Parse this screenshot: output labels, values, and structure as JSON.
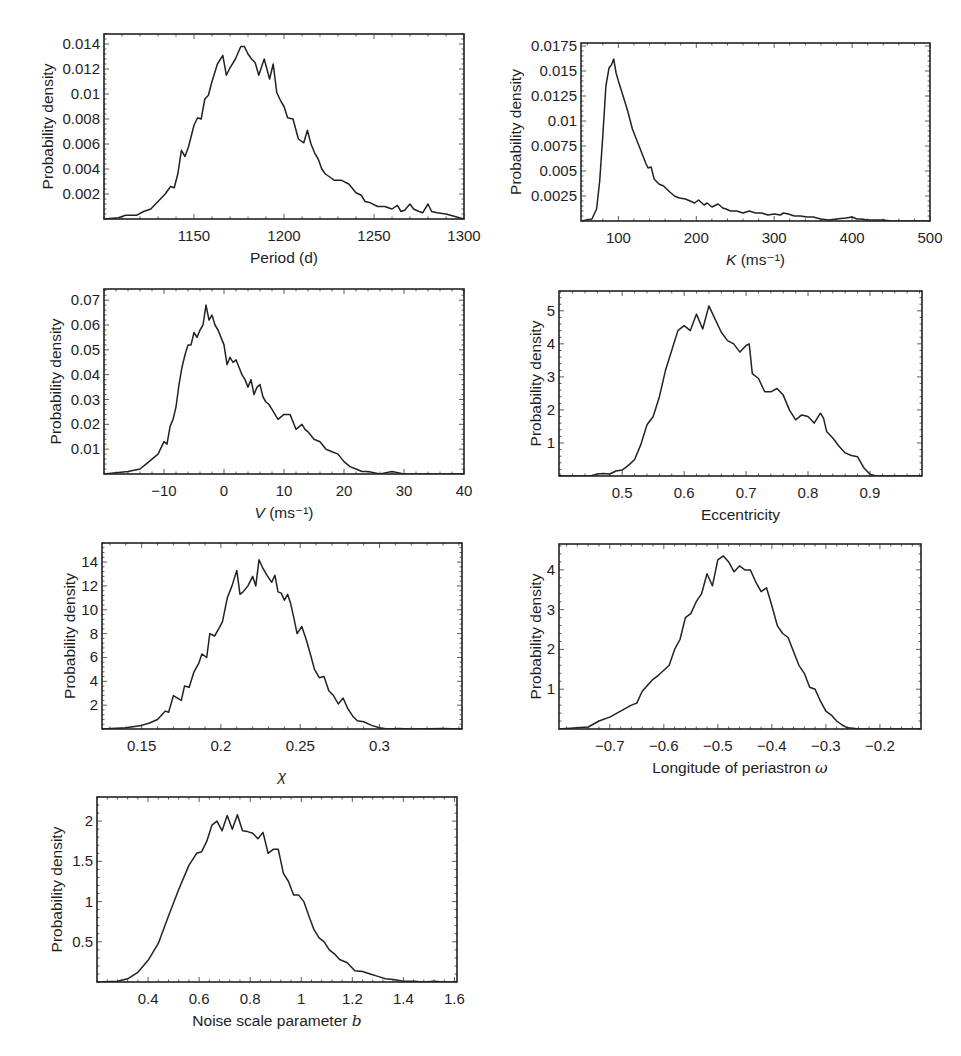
{
  "figure": {
    "background": "#ffffff",
    "line_color": "#222222"
  },
  "chart_data": [
    {
      "id": "period",
      "type": "line",
      "title": "",
      "xlabel": "Period (d)",
      "ylabel": "Probability density",
      "frame": {
        "x": 104,
        "y": 34,
        "w": 360,
        "h": 185
      },
      "xlim": [
        1100,
        1300
      ],
      "ylim": [
        0,
        0.0148
      ],
      "xticks": [
        1150,
        1200,
        1250,
        1300
      ],
      "xtick_labels": [
        "1150",
        "1200",
        "1250",
        "1300"
      ],
      "yticks": [
        0.002,
        0.004,
        0.006,
        0.008,
        0.01,
        0.012,
        0.014
      ],
      "ytick_labels": [
        "0.002",
        "0.004",
        "0.006",
        "0.008",
        "0.01",
        "0.012",
        "0.014"
      ],
      "grid": false,
      "x": [
        1100,
        1108,
        1112,
        1118,
        1122,
        1126,
        1130,
        1134,
        1137,
        1139,
        1141,
        1143,
        1145,
        1147,
        1150,
        1152,
        1154,
        1156,
        1158,
        1160,
        1163,
        1166,
        1168,
        1170,
        1173,
        1176,
        1178,
        1180,
        1182,
        1184,
        1186,
        1189,
        1192,
        1194,
        1196,
        1198,
        1200,
        1202,
        1205,
        1208,
        1211,
        1213,
        1215,
        1217,
        1219,
        1221,
        1223,
        1225,
        1228,
        1232,
        1236,
        1240,
        1243,
        1245,
        1248,
        1252,
        1256,
        1260,
        1263,
        1265,
        1267,
        1270,
        1272,
        1275,
        1277,
        1280,
        1282,
        1285,
        1290,
        1295,
        1300
      ],
      "values": [
        0.0,
        0.0001,
        0.0003,
        0.0003,
        0.0006,
        0.0008,
        0.0014,
        0.002,
        0.0026,
        0.0025,
        0.0036,
        0.0055,
        0.005,
        0.0058,
        0.0075,
        0.0081,
        0.008,
        0.0096,
        0.0099,
        0.011,
        0.0124,
        0.0131,
        0.0115,
        0.0121,
        0.0128,
        0.0138,
        0.0138,
        0.0132,
        0.0128,
        0.0125,
        0.0115,
        0.0128,
        0.0112,
        0.0124,
        0.0101,
        0.0095,
        0.009,
        0.0081,
        0.008,
        0.0064,
        0.0061,
        0.0071,
        0.006,
        0.0053,
        0.0048,
        0.004,
        0.0036,
        0.0034,
        0.0031,
        0.0031,
        0.0028,
        0.0021,
        0.0019,
        0.0014,
        0.0013,
        0.001,
        0.001,
        0.0008,
        0.0011,
        0.0006,
        0.0007,
        0.0012,
        0.0008,
        0.0006,
        0.0005,
        0.0012,
        0.0006,
        0.0005,
        0.0004,
        0.0002,
        0.0
      ]
    },
    {
      "id": "K",
      "type": "line",
      "title": "",
      "xlabel": "K (ms⁻¹)",
      "xlabel_symbol": "K",
      "xlabel_unit": " (ms⁻¹)",
      "ylabel": "Probability density",
      "frame": {
        "x": 581,
        "y": 43,
        "w": 349,
        "h": 178
      },
      "xlim": [
        52,
        500
      ],
      "ylim": [
        0,
        0.0178
      ],
      "xticks": [
        100,
        200,
        300,
        400,
        500
      ],
      "xtick_labels": [
        "100",
        "200",
        "300",
        "400",
        "500"
      ],
      "yticks": [
        0.0025,
        0.005,
        0.0075,
        0.01,
        0.0125,
        0.015,
        0.0175
      ],
      "ytick_labels": [
        "0.0025",
        "0.005",
        "0.0075",
        "0.01",
        "0.0125",
        "0.015",
        "0.0175"
      ],
      "grid": false,
      "x": [
        52,
        66,
        72,
        76,
        80,
        84,
        88,
        91,
        94,
        97,
        100,
        106,
        112,
        118,
        124,
        130,
        135,
        138,
        142,
        146,
        152,
        158,
        166,
        172,
        178,
        186,
        192,
        198,
        203,
        210,
        214,
        220,
        228,
        234,
        238,
        244,
        252,
        260,
        268,
        276,
        284,
        292,
        300,
        308,
        312,
        318,
        326,
        334,
        342,
        350,
        360,
        370,
        380,
        392,
        400,
        406,
        412,
        420,
        430,
        440,
        450,
        470,
        500
      ],
      "values": [
        0.0,
        0.0002,
        0.0012,
        0.004,
        0.0085,
        0.0135,
        0.0153,
        0.0156,
        0.0162,
        0.0148,
        0.014,
        0.0125,
        0.011,
        0.0092,
        0.008,
        0.0068,
        0.0058,
        0.0053,
        0.0054,
        0.0042,
        0.0037,
        0.0035,
        0.0029,
        0.0025,
        0.0023,
        0.0022,
        0.002,
        0.0018,
        0.0021,
        0.0016,
        0.0018,
        0.0014,
        0.0017,
        0.0013,
        0.0012,
        0.001,
        0.001,
        0.0008,
        0.001,
        0.0008,
        0.0008,
        0.0006,
        0.0007,
        0.0006,
        0.0008,
        0.0007,
        0.0005,
        0.0005,
        0.0004,
        0.0004,
        0.0002,
        0.0001,
        0.0002,
        0.0003,
        0.0004,
        0.0002,
        0.0002,
        0.0001,
        0.0001,
        0.0001,
        0.0,
        0.0,
        0.0
      ]
    },
    {
      "id": "V",
      "type": "line",
      "title": "",
      "xlabel": "V (ms⁻¹)",
      "xlabel_symbol": "V",
      "xlabel_unit": " (ms⁻¹)",
      "ylabel": "Probability density",
      "frame": {
        "x": 104,
        "y": 289,
        "w": 360,
        "h": 185
      },
      "xlim": [
        -20,
        40
      ],
      "ylim": [
        0,
        0.0745
      ],
      "xticks": [
        -10,
        0,
        10,
        20,
        30,
        40
      ],
      "xtick_labels": [
        "−10",
        "0",
        "10",
        "20",
        "30",
        "40"
      ],
      "yticks": [
        0.01,
        0.02,
        0.03,
        0.04,
        0.05,
        0.06,
        0.07
      ],
      "ytick_labels": [
        "0.01",
        "0.02",
        "0.03",
        "0.04",
        "0.05",
        "0.06",
        "0.07"
      ],
      "grid": false,
      "x": [
        -20,
        -16,
        -14,
        -13,
        -12,
        -11,
        -10,
        -9.5,
        -9,
        -8.5,
        -8,
        -7.5,
        -7,
        -6.5,
        -6,
        -5.5,
        -5,
        -4.5,
        -4,
        -3.5,
        -3,
        -2.5,
        -2,
        -1.5,
        -1,
        -0.5,
        0,
        0.5,
        1,
        1.5,
        2,
        2.5,
        3,
        3.5,
        4,
        4.5,
        5,
        5.5,
        6,
        6.5,
        7,
        7.5,
        8,
        9,
        10,
        11,
        12,
        13,
        13.5,
        14,
        15,
        16,
        17,
        18,
        19,
        20,
        21,
        22,
        23,
        24,
        26,
        28,
        30,
        34,
        40
      ],
      "values": [
        0.0,
        0.001,
        0.002,
        0.004,
        0.006,
        0.008,
        0.013,
        0.012,
        0.019,
        0.022,
        0.027,
        0.036,
        0.043,
        0.048,
        0.052,
        0.052,
        0.057,
        0.055,
        0.058,
        0.06,
        0.068,
        0.062,
        0.064,
        0.06,
        0.058,
        0.055,
        0.052,
        0.044,
        0.047,
        0.045,
        0.046,
        0.043,
        0.04,
        0.038,
        0.035,
        0.038,
        0.032,
        0.035,
        0.036,
        0.031,
        0.029,
        0.028,
        0.026,
        0.022,
        0.024,
        0.024,
        0.018,
        0.02,
        0.018,
        0.017,
        0.014,
        0.013,
        0.01,
        0.009,
        0.008,
        0.005,
        0.003,
        0.002,
        0.001,
        0.001,
        0.0,
        0.001,
        0.0,
        0.0,
        0.0
      ]
    },
    {
      "id": "eccentricity",
      "type": "line",
      "title": "",
      "xlabel": "Eccentricity",
      "ylabel": "Probability density",
      "frame": {
        "x": 559,
        "y": 291,
        "w": 363,
        "h": 185
      },
      "xlim": [
        0.398,
        0.984
      ],
      "ylim": [
        0,
        5.6
      ],
      "xticks": [
        0.5,
        0.6,
        0.7,
        0.8,
        0.9
      ],
      "xtick_labels": [
        "0.5",
        "0.6",
        "0.7",
        "0.8",
        "0.9"
      ],
      "yticks": [
        1,
        2,
        3,
        4,
        5
      ],
      "ytick_labels": [
        "1",
        "2",
        "3",
        "4",
        "5"
      ],
      "grid": false,
      "x": [
        0.398,
        0.44,
        0.45,
        0.46,
        0.47,
        0.48,
        0.49,
        0.5,
        0.51,
        0.52,
        0.53,
        0.54,
        0.55,
        0.56,
        0.57,
        0.58,
        0.59,
        0.6,
        0.61,
        0.62,
        0.63,
        0.64,
        0.65,
        0.66,
        0.67,
        0.68,
        0.69,
        0.7,
        0.705,
        0.71,
        0.72,
        0.73,
        0.74,
        0.75,
        0.76,
        0.77,
        0.78,
        0.79,
        0.8,
        0.81,
        0.82,
        0.825,
        0.83,
        0.84,
        0.85,
        0.86,
        0.87,
        0.88,
        0.89,
        0.9,
        0.91,
        0.95,
        0.984
      ],
      "values": [
        0.0,
        0.0,
        0.01,
        0.06,
        0.08,
        0.06,
        0.15,
        0.18,
        0.32,
        0.5,
        0.95,
        1.55,
        1.8,
        2.4,
        3.2,
        3.8,
        4.4,
        4.55,
        4.4,
        4.9,
        4.45,
        5.15,
        4.75,
        4.35,
        4.1,
        4.0,
        3.75,
        3.95,
        4.0,
        3.1,
        2.95,
        2.55,
        2.55,
        2.65,
        2.45,
        2.0,
        1.7,
        1.85,
        1.8,
        1.6,
        1.9,
        1.75,
        1.35,
        1.15,
        0.9,
        0.7,
        0.62,
        0.58,
        0.25,
        0.05,
        0.0,
        0.0,
        0.0
      ]
    },
    {
      "id": "chi",
      "type": "line",
      "title": "",
      "xlabel": "χ",
      "ylabel": "Probability density",
      "frame": {
        "x": 102,
        "y": 543,
        "w": 360,
        "h": 186
      },
      "xlim": [
        0.125,
        0.352
      ],
      "ylim": [
        0,
        15.6
      ],
      "xticks": [
        0.15,
        0.2,
        0.25,
        0.3
      ],
      "xtick_labels": [
        "0.15",
        "0.2",
        "0.25",
        "0.3"
      ],
      "yticks": [
        2,
        4,
        6,
        8,
        10,
        12,
        14
      ],
      "ytick_labels": [
        "2",
        "4",
        "6",
        "8",
        "10",
        "12",
        "14"
      ],
      "grid": false,
      "x": [
        0.125,
        0.14,
        0.15,
        0.155,
        0.16,
        0.165,
        0.167,
        0.17,
        0.175,
        0.177,
        0.18,
        0.183,
        0.186,
        0.188,
        0.191,
        0.193,
        0.196,
        0.199,
        0.201,
        0.204,
        0.207,
        0.21,
        0.212,
        0.214,
        0.217,
        0.22,
        0.222,
        0.224,
        0.226,
        0.229,
        0.232,
        0.234,
        0.236,
        0.238,
        0.24,
        0.242,
        0.244,
        0.246,
        0.248,
        0.251,
        0.254,
        0.257,
        0.259,
        0.262,
        0.265,
        0.268,
        0.271,
        0.274,
        0.277,
        0.28,
        0.283,
        0.286,
        0.29,
        0.295,
        0.3,
        0.305,
        0.312,
        0.32,
        0.34,
        0.352
      ],
      "values": [
        0.0,
        0.1,
        0.3,
        0.5,
        0.8,
        1.5,
        1.4,
        2.8,
        2.4,
        3.6,
        3.5,
        4.8,
        5.5,
        6.3,
        6.0,
        8.0,
        7.8,
        8.5,
        9.0,
        11.0,
        12.0,
        13.3,
        11.3,
        11.5,
        12.0,
        12.8,
        12.0,
        14.2,
        13.6,
        12.9,
        12.3,
        12.9,
        11.5,
        11.4,
        10.8,
        11.3,
        10.5,
        9.3,
        8.0,
        8.6,
        7.4,
        6.0,
        5.0,
        4.3,
        4.4,
        3.2,
        2.8,
        2.1,
        2.6,
        1.7,
        1.1,
        0.7,
        0.6,
        0.3,
        0.1,
        0.0,
        0.05,
        0.0,
        0.05,
        0.0
      ]
    },
    {
      "id": "omega",
      "type": "line",
      "title": "",
      "xlabel": "Longitude of periastron ω",
      "xlabel_symbol": "ω",
      "xlabel_text": "Longitude of periastron ",
      "ylabel": "Probability density",
      "frame": {
        "x": 559,
        "y": 544,
        "w": 362,
        "h": 185
      },
      "xlim": [
        -0.794,
        -0.124
      ],
      "ylim": [
        0,
        4.65
      ],
      "xticks": [
        -0.7,
        -0.6,
        -0.5,
        -0.4,
        -0.3,
        -0.2
      ],
      "xtick_labels": [
        "−0.7",
        "−0.6",
        "−0.5",
        "−0.4",
        "−0.3",
        "−0.2"
      ],
      "yticks": [
        1,
        2,
        3,
        4
      ],
      "ytick_labels": [
        "1",
        "2",
        "3",
        "4"
      ],
      "grid": false,
      "x": [
        -0.794,
        -0.76,
        -0.74,
        -0.72,
        -0.7,
        -0.68,
        -0.66,
        -0.65,
        -0.64,
        -0.62,
        -0.61,
        -0.59,
        -0.58,
        -0.57,
        -0.56,
        -0.55,
        -0.54,
        -0.53,
        -0.52,
        -0.51,
        -0.5,
        -0.49,
        -0.48,
        -0.47,
        -0.46,
        -0.45,
        -0.44,
        -0.43,
        -0.42,
        -0.41,
        -0.4,
        -0.39,
        -0.38,
        -0.37,
        -0.36,
        -0.35,
        -0.34,
        -0.33,
        -0.32,
        -0.31,
        -0.3,
        -0.29,
        -0.28,
        -0.27,
        -0.26,
        -0.25,
        -0.24,
        -0.23,
        -0.22,
        -0.2,
        -0.124
      ],
      "values": [
        0.0,
        0.03,
        0.05,
        0.2,
        0.3,
        0.45,
        0.6,
        0.65,
        0.95,
        1.25,
        1.35,
        1.6,
        2.0,
        2.25,
        2.8,
        2.9,
        3.2,
        3.4,
        3.9,
        3.6,
        4.25,
        4.35,
        4.2,
        3.95,
        4.1,
        4.0,
        4.0,
        3.7,
        3.45,
        3.55,
        3.1,
        2.6,
        2.4,
        2.3,
        1.95,
        1.6,
        1.4,
        1.05,
        1.0,
        0.7,
        0.45,
        0.35,
        0.2,
        0.1,
        0.03,
        0.02,
        0.0,
        0.0,
        0.0,
        0.0,
        0.0
      ]
    },
    {
      "id": "noise_b",
      "type": "line",
      "title": "",
      "xlabel": "Noise scale parameter b",
      "xlabel_symbol": "b",
      "xlabel_text": "Noise scale parameter ",
      "ylabel": "Probability density",
      "frame": {
        "x": 97,
        "y": 797,
        "w": 360,
        "h": 185
      },
      "xlim": [
        0.2,
        1.61
      ],
      "ylim": [
        0,
        2.3
      ],
      "xticks": [
        0.4,
        0.6,
        0.8,
        1.0,
        1.2,
        1.4,
        1.6
      ],
      "xtick_labels": [
        "0.4",
        "0.6",
        "0.8",
        "1",
        "1.2",
        "1.4",
        "1.6"
      ],
      "yticks": [
        0.5,
        1,
        1.5,
        2
      ],
      "ytick_labels": [
        "0.5",
        "1",
        "1.5",
        "2"
      ],
      "grid": false,
      "x": [
        0.2,
        0.28,
        0.32,
        0.36,
        0.4,
        0.44,
        0.48,
        0.52,
        0.56,
        0.59,
        0.61,
        0.63,
        0.65,
        0.67,
        0.69,
        0.71,
        0.73,
        0.75,
        0.77,
        0.79,
        0.81,
        0.83,
        0.85,
        0.87,
        0.89,
        0.91,
        0.93,
        0.95,
        0.97,
        0.99,
        1.01,
        1.03,
        1.05,
        1.07,
        1.09,
        1.11,
        1.13,
        1.15,
        1.18,
        1.21,
        1.24,
        1.27,
        1.3,
        1.33,
        1.36,
        1.4,
        1.44,
        1.48,
        1.52,
        1.56,
        1.61
      ],
      "values": [
        0.0,
        0.01,
        0.04,
        0.12,
        0.27,
        0.48,
        0.82,
        1.15,
        1.45,
        1.6,
        1.62,
        1.75,
        1.95,
        2.0,
        1.88,
        2.07,
        1.9,
        2.08,
        1.88,
        1.87,
        1.85,
        1.78,
        1.86,
        1.6,
        1.65,
        1.65,
        1.35,
        1.25,
        1.08,
        1.08,
        1.0,
        0.82,
        0.65,
        0.55,
        0.5,
        0.4,
        0.35,
        0.28,
        0.24,
        0.14,
        0.13,
        0.1,
        0.07,
        0.04,
        0.03,
        0.01,
        0.01,
        0.0,
        0.01,
        0.0,
        0.0
      ]
    }
  ]
}
